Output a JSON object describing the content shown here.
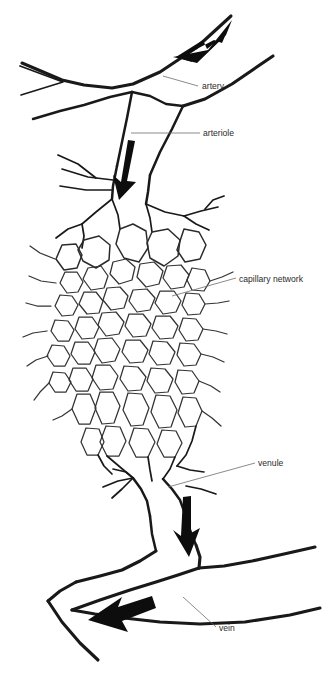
{
  "figure": {
    "background_color": "#ffffff",
    "vessel_stroke_color": "#191919",
    "arrow_color": "#0d0d0d",
    "leader_color": "#6d6d6d",
    "label_color": "#2a2a2a"
  },
  "labels": {
    "artery": "artery",
    "arteriole": "arteriole",
    "capillary_network": "capillary network",
    "venule": "venule",
    "vein": "vein"
  },
  "flow_arrows": [
    {
      "name": "artery-flow-arrow",
      "direction": "down-left"
    },
    {
      "name": "arteriole-flow-arrow",
      "direction": "down"
    },
    {
      "name": "venule-flow-arrow",
      "direction": "down"
    },
    {
      "name": "vein-flow-arrow",
      "direction": "left"
    }
  ]
}
